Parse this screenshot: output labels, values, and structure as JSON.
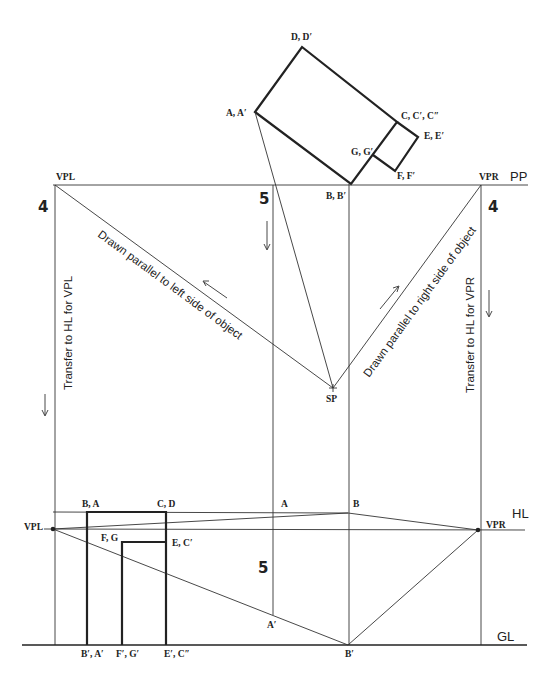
{
  "plan_view": {
    "corner_labels": {
      "D": "D, D′",
      "A": "A, A′",
      "C": "C, C′, C″",
      "E": "E, E′",
      "G": "G, G′",
      "F": "F, F′",
      "B": "B, B′"
    },
    "picture_plane_label": "PP",
    "vpl_label": "VPL",
    "vpr_label": "VPR",
    "station_point_label": "SP",
    "step_left": "4",
    "step_right": "4",
    "step_mid": "5",
    "left_parallel_note": "Drawn parallel to left side of object",
    "right_parallel_note": "Drawn parallel to right side of object",
    "left_transfer_note": "Transfer to HL for VPL",
    "right_transfer_note": "Transfer to HL for VPR"
  },
  "perspective_view": {
    "horizon_label": "HL",
    "ground_label": "GL",
    "vpl_label": "VPL",
    "vpr_label": "VPR",
    "step_mid": "5",
    "labels": {
      "BA": "B, A",
      "CD": "C, D",
      "FG": "F, G",
      "EC": "E, C′",
      "A_top": "A",
      "B_top": "B",
      "A_prime": "A′",
      "B_prime": "B′",
      "BpAp": "B′, A′",
      "FpGp": "F′, G′",
      "EpCpp": "E′, C″"
    }
  }
}
